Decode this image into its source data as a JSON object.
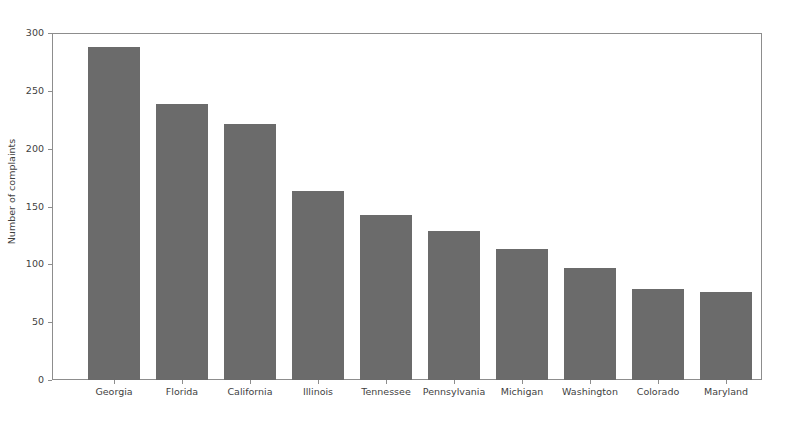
{
  "chart_data": {
    "type": "bar",
    "title": "",
    "xlabel": "",
    "ylabel": "Number of complaints",
    "categories": [
      "Georgia",
      "Florida",
      "California",
      "Illinois",
      "Tennessee",
      "Pennsylvania",
      "Michigan",
      "Washington",
      "Colorado",
      "Maryland"
    ],
    "values": [
      288,
      239,
      221,
      163,
      143,
      129,
      113,
      97,
      79,
      76
    ],
    "ylim": [
      0,
      300
    ],
    "yticks": [
      0,
      50,
      100,
      150,
      200,
      250,
      300
    ],
    "ytick_labels": [
      "0",
      "50",
      "100",
      "150",
      "200",
      "250",
      "300"
    ],
    "grid": false,
    "legend": null,
    "bar_color": "#6b6b6b",
    "axis_color": "#8d8d8d",
    "text_color": "#3f3f3f",
    "background_color": "#ffffff"
  }
}
